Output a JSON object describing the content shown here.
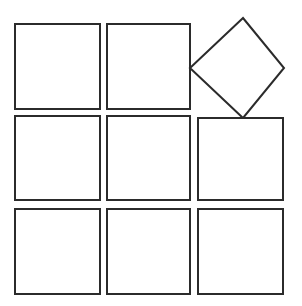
{
  "figure": {
    "canvas": {
      "width": 302,
      "height": 306,
      "background_color": "#ffffff"
    },
    "style": {
      "stroke_color": "#2b2b2b",
      "stroke_width": 2,
      "fill_color": "#ffffff"
    },
    "grid": {
      "rows": 3,
      "columns": 3,
      "cell_count": 9,
      "column_x_ranges": [
        [
          15,
          100
        ],
        [
          107,
          190
        ],
        [
          198,
          283
        ]
      ],
      "row_y_ranges": [
        [
          24,
          109
        ],
        [
          116,
          200
        ],
        [
          209,
          294
        ]
      ]
    },
    "shapes": [
      {
        "name": "square-r1c1",
        "kind": "square",
        "row": 1,
        "column": 1,
        "x": 15,
        "y": 24,
        "width": 85,
        "height": 85,
        "rotation_degrees": 0
      },
      {
        "name": "square-r1c2",
        "kind": "square",
        "row": 1,
        "column": 2,
        "x": 107,
        "y": 24,
        "width": 83,
        "height": 85,
        "rotation_degrees": 0
      },
      {
        "name": "diamond-r1c3",
        "kind": "diamond",
        "row": 1,
        "column": 3,
        "points": "243,18 284,68 243,118 190,68",
        "rotation_degrees": 45,
        "diagonal_width": 94,
        "diagonal_height": 100
      },
      {
        "name": "square-r2c1",
        "kind": "square",
        "row": 2,
        "column": 1,
        "x": 15,
        "y": 116,
        "width": 85,
        "height": 84,
        "rotation_degrees": 0
      },
      {
        "name": "square-r2c2",
        "kind": "square",
        "row": 2,
        "column": 2,
        "x": 107,
        "y": 116,
        "width": 83,
        "height": 84,
        "rotation_degrees": 0
      },
      {
        "name": "square-r2c3",
        "kind": "square",
        "row": 2,
        "column": 3,
        "x": 198,
        "y": 118,
        "width": 85,
        "height": 82,
        "rotation_degrees": 0
      },
      {
        "name": "square-r3c1",
        "kind": "square",
        "row": 3,
        "column": 1,
        "x": 15,
        "y": 209,
        "width": 85,
        "height": 85,
        "rotation_degrees": 0
      },
      {
        "name": "square-r3c2",
        "kind": "square",
        "row": 3,
        "column": 2,
        "x": 107,
        "y": 209,
        "width": 83,
        "height": 85,
        "rotation_degrees": 0
      },
      {
        "name": "square-r3c3",
        "kind": "square",
        "row": 3,
        "column": 3,
        "x": 198,
        "y": 209,
        "width": 85,
        "height": 85,
        "rotation_degrees": 0
      }
    ]
  }
}
